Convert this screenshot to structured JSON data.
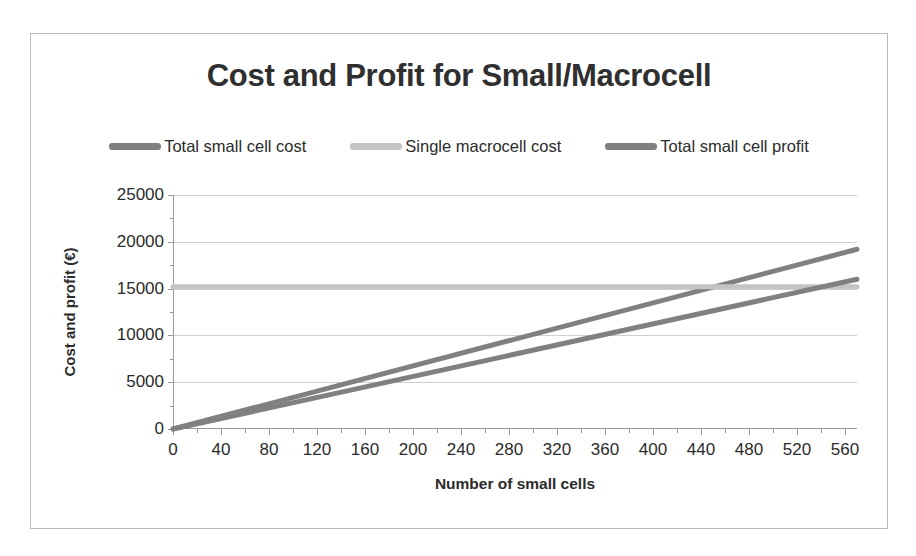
{
  "chart_data": {
    "type": "line",
    "title": "Cost and Profit for Small/Macrocell",
    "xlabel": "Number of small cells",
    "ylabel": "Cost and profit (€)",
    "xlim": [
      0,
      570
    ],
    "ylim": [
      0,
      25000
    ],
    "xticks": [
      0,
      40,
      80,
      120,
      160,
      200,
      240,
      280,
      320,
      360,
      400,
      440,
      480,
      520,
      560
    ],
    "xtick_labels": [
      "0",
      "40",
      "80",
      "120",
      "160",
      "200",
      "240",
      "280",
      "320",
      "360",
      "400",
      "440",
      "480",
      "520",
      "560"
    ],
    "xminor_step": 20,
    "yticks": [
      0,
      5000,
      10000,
      15000,
      20000,
      25000
    ],
    "ytick_labels": [
      "0",
      "5000",
      "10000",
      "15000",
      "20000",
      "25000"
    ],
    "yminor_step": 2500,
    "grid": "horizontal",
    "legend_position": "top",
    "series": [
      {
        "name": "Total small cell cost",
        "color": "#808080",
        "kind": "line",
        "x": [
          0,
          570
        ],
        "values": [
          0,
          19200
        ],
        "slope_per_cell": 33.7
      },
      {
        "name": "Single macrocell cost",
        "color": "#c4c4c4",
        "kind": "constant",
        "x": [
          0,
          570
        ],
        "values": [
          15200,
          15200
        ]
      },
      {
        "name": "Total small cell profit",
        "color": "#808080",
        "kind": "line",
        "x": [
          0,
          570
        ],
        "values": [
          0,
          16000
        ],
        "slope_per_cell": 28.1
      }
    ],
    "annotations": [],
    "crossings": [
      {
        "series": "Total small cell cost",
        "crosses": "Single macrocell cost",
        "x": 450
      },
      {
        "series": "Total small cell profit",
        "crosses": "Single macrocell cost",
        "x": 541
      }
    ]
  },
  "chart": {
    "title": "Cost and Profit for Small/Macrocell",
    "x_axis_title": "Number of small cells",
    "y_axis_title": "Cost and profit (€)"
  },
  "legend": {
    "items": [
      {
        "label": "Total small cell cost",
        "color": "#808080"
      },
      {
        "label": "Single macrocell cost",
        "color": "#c4c4c4"
      },
      {
        "label": "Total small cell profit",
        "color": "#808080"
      }
    ]
  },
  "colors": {
    "cost_line": "#808080",
    "macrocell_line": "#c4c4c4",
    "profit_line": "#808080",
    "gridline": "#cfcfcf",
    "axis": "#9a9a9a",
    "border": "#b9b9b9",
    "text": "#2b2b2b"
  }
}
